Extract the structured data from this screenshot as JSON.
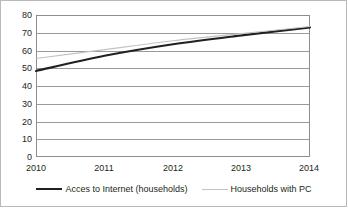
{
  "chart_data": {
    "type": "line",
    "title": "",
    "subtitle": "",
    "xlabel": "",
    "ylabel": "",
    "categories": [
      "2010",
      "2011",
      "2012",
      "2013",
      "2014"
    ],
    "x": [
      2010,
      2011,
      2012,
      2013,
      2014
    ],
    "series": [
      {
        "name": "Acces to Internet (households)",
        "values": [
          48.5,
          57.0,
          63.5,
          68.5,
          73.0
        ],
        "color": "#231f20",
        "width": 2.1
      },
      {
        "name": "Households with PC",
        "values": [
          55.5,
          60.5,
          65.5,
          69.5,
          73.5
        ],
        "color": "#c3c3c3",
        "width": 1.1
      }
    ],
    "ylim": [
      0,
      80
    ],
    "yticks": [
      "0",
      "10",
      "20",
      "30",
      "40",
      "50",
      "60",
      "70",
      "80"
    ],
    "ytick_values": [
      0,
      10,
      20,
      30,
      40,
      50,
      60,
      70,
      80
    ],
    "xlim": [
      2010,
      2014
    ],
    "grid": "horizontal",
    "legend_position": "bottom",
    "legend": [
      {
        "label": "Acces to Internet (households)",
        "swatch": "series-internet"
      },
      {
        "label": "Households with PC",
        "swatch": "series-pc"
      }
    ],
    "annotations": [],
    "colors": {
      "axis": "#8d8d8d",
      "grid": "#9a9a9a",
      "text": "#231f20",
      "background": "#ffffff",
      "border": "#b9b9b9"
    }
  }
}
